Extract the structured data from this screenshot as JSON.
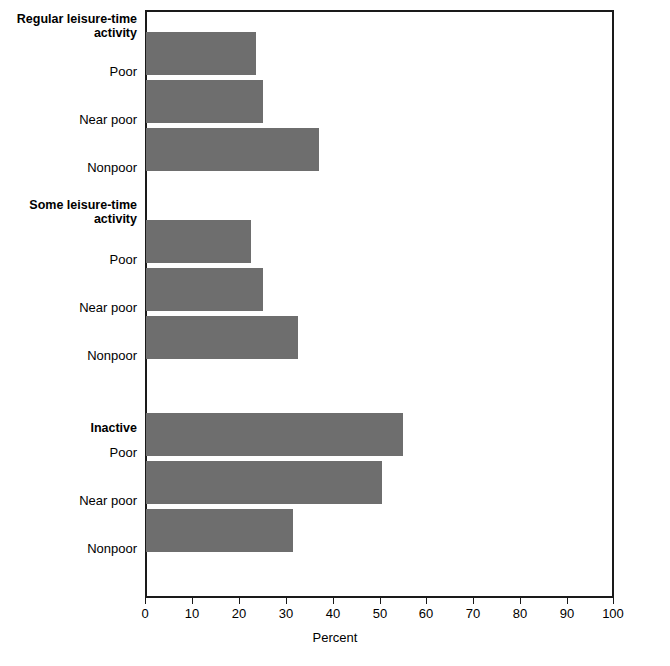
{
  "chart_data": {
    "type": "bar",
    "orientation": "horizontal",
    "title": "",
    "subtitle": "",
    "xlabel": "Percent",
    "ylabel": "",
    "xlim": [
      0,
      100
    ],
    "xticks": [
      0,
      10,
      20,
      30,
      40,
      50,
      60,
      70,
      80,
      90,
      100
    ],
    "xtick_labels": [
      "0",
      "10",
      "20",
      "30",
      "40",
      "50",
      "60",
      "70",
      "80",
      "90",
      "100"
    ],
    "grid": false,
    "legend": false,
    "bar_color": "#6e6e6e",
    "axis_color": "#1a1a1a",
    "groups": [
      {
        "name": "Regular leisure-time\nactivity",
        "categories": [
          "Poor",
          "Near poor",
          "Nonpoor"
        ],
        "values": [
          23.5,
          25.0,
          37.0
        ]
      },
      {
        "name": "Some leisure-time\nactivity",
        "categories": [
          "Poor",
          "Near poor",
          "Nonpoor"
        ],
        "values": [
          22.5,
          25.0,
          32.5
        ]
      },
      {
        "name": "Inactive",
        "categories": [
          "Poor",
          "Near poor",
          "Nonpoor"
        ],
        "values": [
          55.0,
          50.5,
          31.5
        ]
      }
    ],
    "categories": [
      "Regular leisure-time activity: Poor",
      "Regular leisure-time activity: Near poor",
      "Regular leisure-time activity: Nonpoor",
      "Some leisure-time activity: Poor",
      "Some leisure-time activity: Near poor",
      "Some leisure-time activity: Nonpoor",
      "Inactive: Poor",
      "Inactive: Near poor",
      "Inactive: Nonpoor"
    ],
    "values": [
      23.5,
      25.0,
      37.0,
      22.5,
      25.0,
      32.5,
      55.0,
      50.5,
      31.5
    ]
  },
  "labels": {
    "group1_head": "Regular leisure-time\nactivity",
    "group1_poor": "Poor",
    "group1_near_poor": "Near poor",
    "group1_nonpoor": "Nonpoor",
    "group2_head": "Some leisure-time\nactivity",
    "group2_poor": "Poor",
    "group2_near_poor": "Near poor",
    "group2_nonpoor": "Nonpoor",
    "group3_head": "Inactive",
    "group3_poor": "Poor",
    "group3_near_poor": "Near poor",
    "group3_nonpoor": "Nonpoor"
  },
  "axis": {
    "title": "Percent",
    "t0": "0",
    "t10": "10",
    "t20": "20",
    "t30": "30",
    "t40": "40",
    "t50": "50",
    "t60": "60",
    "t70": "70",
    "t80": "80",
    "t90": "90",
    "t100": "100"
  }
}
